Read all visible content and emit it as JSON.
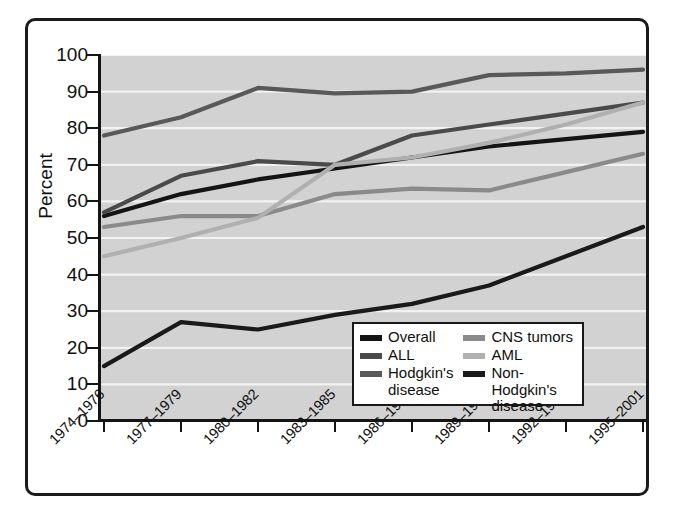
{
  "chart_data": {
    "type": "line",
    "title": "",
    "xlabel": "",
    "ylabel": "Percent",
    "ylim": [
      0,
      100
    ],
    "yticks": [
      0,
      10,
      20,
      30,
      40,
      50,
      60,
      70,
      80,
      90,
      100
    ],
    "grid": "horizontal",
    "legend_position": "bottom-right",
    "plot_background": "#d2d2d2",
    "categories": [
      "1974–1976",
      "1977–1979",
      "1980–1982",
      "1983–1985",
      "1986–1988",
      "1989–1991",
      "1992–1994",
      "1995–2001"
    ],
    "series": [
      {
        "name": "Overall",
        "color": "#141414",
        "values": [
          56,
          62,
          66,
          69,
          72,
          75,
          77,
          79
        ]
      },
      {
        "name": "ALL",
        "color": "#4a4a4a",
        "values": [
          57,
          67,
          71,
          70,
          78,
          81,
          84,
          87
        ]
      },
      {
        "name": "Hodgkin's disease",
        "color": "#595959",
        "values": [
          78,
          83,
          91,
          89.5,
          90,
          94.5,
          95,
          96
        ]
      },
      {
        "name": "CNS tumors",
        "color": "#8a8a8a",
        "values": [
          53,
          56,
          56,
          62,
          63.5,
          63,
          68,
          73
        ]
      },
      {
        "name": "AML",
        "color": "#b0b0b0",
        "values": [
          45,
          50,
          55.5,
          70,
          72,
          76,
          81,
          87
        ]
      },
      {
        "name": "Non-Hodgkin's disease",
        "color": "#1a1a1a",
        "values": [
          15,
          27,
          25,
          29,
          32,
          37,
          45,
          53
        ]
      }
    ]
  },
  "axes": {
    "y_title": "Percent",
    "y_tick_labels": [
      "100",
      "90",
      "80",
      "70",
      "60",
      "50",
      "40",
      "30",
      "20",
      "10",
      "0"
    ],
    "x_tick_labels": [
      "1974–1976",
      "1977–1979",
      "1980–1982",
      "1983–1985",
      "1986–1988",
      "1989–1991",
      "1992–1994",
      "1995–2001"
    ]
  },
  "legend": {
    "left_column": [
      {
        "label": "Overall",
        "label_line2": "",
        "color": "#141414"
      },
      {
        "label": "ALL",
        "label_line2": "",
        "color": "#4a4a4a"
      },
      {
        "label": "Hodgkin's",
        "label_line2": "disease",
        "color": "#595959"
      }
    ],
    "right_column": [
      {
        "label": "CNS tumors",
        "label_line2": "",
        "color": "#8a8a8a"
      },
      {
        "label": "AML",
        "label_line2": "",
        "color": "#b0b0b0"
      },
      {
        "label": "Non-Hodgkin's",
        "label_line2": "disease",
        "color": "#1a1a1a"
      }
    ]
  }
}
